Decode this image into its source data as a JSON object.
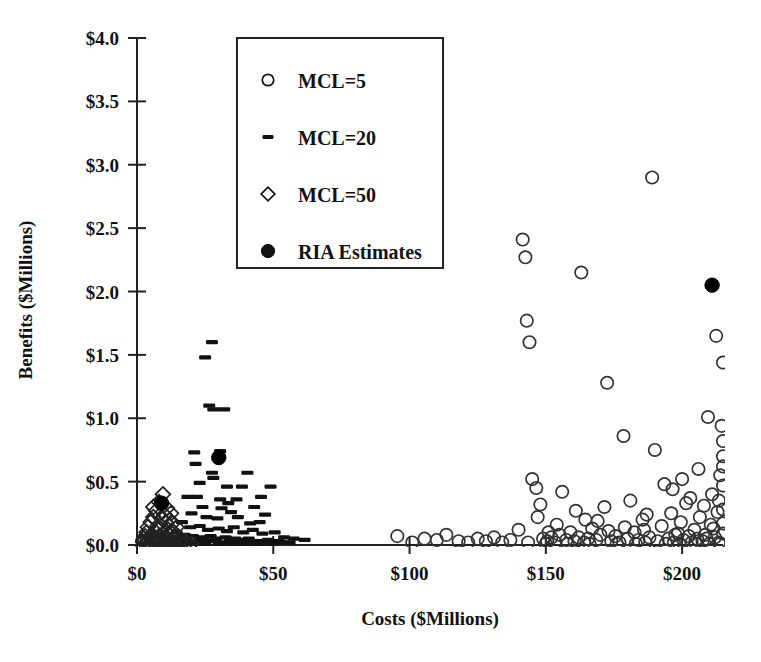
{
  "chart_data": {
    "type": "scatter",
    "title": "",
    "xlabel": "Costs ($Millions)",
    "ylabel": "Benefits ($Millions)",
    "xlim": [
      0,
      215
    ],
    "ylim": [
      0,
      4.0
    ],
    "xticks": [
      0,
      50,
      100,
      150,
      200
    ],
    "xticklabels": [
      "$0",
      "$50",
      "$100",
      "$150",
      "$200"
    ],
    "yticks": [
      0.0,
      0.5,
      1.0,
      1.5,
      2.0,
      2.5,
      3.0,
      3.5,
      4.0
    ],
    "yticklabels": [
      "$0.0",
      "$0.5",
      "$1.0",
      "$1.5",
      "$2.0",
      "$2.5",
      "$3.0",
      "$3.5",
      "$4.0"
    ],
    "grid": false,
    "legend_position": "upper-left-inside",
    "series": [
      {
        "name": "MCL=5",
        "marker": "open-circle",
        "color": "#333333",
        "points": [
          [
            95.5,
            0.07
          ],
          [
            101.0,
            0.02
          ],
          [
            105.5,
            0.05
          ],
          [
            110.0,
            0.04
          ],
          [
            113.5,
            0.08
          ],
          [
            118.0,
            0.03
          ],
          [
            121.5,
            0.02
          ],
          [
            125.0,
            0.05
          ],
          [
            128.0,
            0.03
          ],
          [
            131.0,
            0.06
          ],
          [
            134.0,
            0.02
          ],
          [
            137.0,
            0.04
          ],
          [
            140.0,
            0.12
          ],
          [
            141.5,
            2.41
          ],
          [
            142.5,
            2.27
          ],
          [
            143.0,
            1.77
          ],
          [
            144.0,
            1.6
          ],
          [
            145.0,
            0.52
          ],
          [
            146.5,
            0.45
          ],
          [
            148.0,
            0.32
          ],
          [
            149.0,
            0.05
          ],
          [
            150.5,
            0.03
          ],
          [
            152.0,
            0.06
          ],
          [
            153.5,
            0.02
          ],
          [
            155.0,
            0.08
          ],
          [
            156.0,
            0.42
          ],
          [
            157.5,
            0.04
          ],
          [
            159.0,
            0.1
          ],
          [
            160.5,
            0.03
          ],
          [
            162.0,
            0.06
          ],
          [
            163.0,
            2.15
          ],
          [
            164.0,
            0.02
          ],
          [
            165.5,
            0.05
          ],
          [
            167.0,
            0.13
          ],
          [
            168.5,
            0.04
          ],
          [
            170.0,
            0.08
          ],
          [
            171.5,
            0.3
          ],
          [
            172.5,
            1.28
          ],
          [
            174.0,
            0.03
          ],
          [
            175.5,
            0.07
          ],
          [
            177.0,
            0.02
          ],
          [
            178.5,
            0.86
          ],
          [
            180.0,
            0.05
          ],
          [
            181.0,
            0.35
          ],
          [
            182.5,
            0.1
          ],
          [
            184.0,
            0.04
          ],
          [
            185.5,
            0.2
          ],
          [
            186.5,
            0.02
          ],
          [
            188.0,
            0.06
          ],
          [
            189.0,
            2.9
          ],
          [
            190.0,
            0.75
          ],
          [
            191.0,
            0.03
          ],
          [
            192.5,
            0.15
          ],
          [
            193.5,
            0.48
          ],
          [
            195.0,
            0.05
          ],
          [
            196.0,
            0.25
          ],
          [
            197.0,
            0.02
          ],
          [
            198.5,
            0.09
          ],
          [
            199.5,
            0.18
          ],
          [
            200.5,
            0.04
          ],
          [
            201.5,
            0.33
          ],
          [
            202.5,
            0.07
          ],
          [
            203.5,
            0.02
          ],
          [
            204.5,
            0.12
          ],
          [
            205.5,
            0.05
          ],
          [
            206.5,
            0.22
          ],
          [
            207.5,
            0.03
          ],
          [
            208.5,
            0.08
          ],
          [
            209.5,
            1.01
          ],
          [
            210.5,
            0.16
          ],
          [
            211.0,
            0.4
          ],
          [
            212.0,
            0.06
          ],
          [
            212.5,
            1.65
          ],
          [
            213.0,
            0.26
          ],
          [
            213.5,
            0.02
          ],
          [
            214.0,
            0.55
          ],
          [
            214.5,
            0.94
          ],
          [
            215.0,
            1.44
          ],
          [
            215.0,
            0.82
          ],
          [
            215.0,
            0.7
          ],
          [
            215.0,
            0.62
          ],
          [
            215.0,
            0.47
          ],
          [
            215.0,
            0.28
          ],
          [
            215.0,
            0.17
          ],
          [
            215.0,
            0.09
          ],
          [
            150.0,
            0.01
          ],
          [
            158.0,
            0.01
          ],
          [
            166.0,
            0.01
          ],
          [
            176.0,
            0.01
          ],
          [
            183.0,
            0.01
          ],
          [
            194.0,
            0.01
          ],
          [
            199.0,
            0.01
          ],
          [
            205.0,
            0.01
          ],
          [
            210.0,
            0.01
          ],
          [
            214.0,
            0.01
          ],
          [
            147.0,
            0.22
          ],
          [
            154.0,
            0.16
          ],
          [
            161.0,
            0.27
          ],
          [
            169.0,
            0.19
          ],
          [
            173.0,
            0.11
          ],
          [
            179.0,
            0.14
          ],
          [
            187.0,
            0.24
          ],
          [
            196.5,
            0.44
          ],
          [
            203.0,
            0.37
          ],
          [
            208.0,
            0.31
          ],
          [
            143.5,
            0.02
          ],
          [
            151.0,
            0.1
          ],
          [
            164.5,
            0.2
          ],
          [
            186.0,
            0.12
          ],
          [
            200.0,
            0.52
          ],
          [
            206.0,
            0.6
          ],
          [
            211.5,
            0.13
          ],
          [
            213.5,
            0.35
          ],
          [
            209.0,
            0.05
          ],
          [
            197.5,
            0.08
          ]
        ]
      },
      {
        "name": "MCL=20",
        "marker": "dash",
        "color": "#111111",
        "points": [
          [
            27.5,
            1.6
          ],
          [
            25.0,
            1.48
          ],
          [
            26.5,
            1.1
          ],
          [
            28.0,
            1.07
          ],
          [
            32.0,
            1.07
          ],
          [
            21.0,
            0.73
          ],
          [
            21.5,
            0.64
          ],
          [
            27.5,
            0.57
          ],
          [
            28.0,
            0.53
          ],
          [
            40.5,
            0.57
          ],
          [
            38.5,
            0.46
          ],
          [
            49.0,
            0.46
          ],
          [
            18.5,
            0.38
          ],
          [
            22.0,
            0.38
          ],
          [
            30.5,
            0.36
          ],
          [
            33.5,
            0.33
          ],
          [
            36.5,
            0.36
          ],
          [
            24.0,
            0.3
          ],
          [
            31.0,
            0.29
          ],
          [
            34.5,
            0.26
          ],
          [
            43.0,
            0.3
          ],
          [
            47.0,
            0.24
          ],
          [
            20.0,
            0.25
          ],
          [
            25.5,
            0.22
          ],
          [
            29.5,
            0.21
          ],
          [
            37.0,
            0.22
          ],
          [
            41.5,
            0.17
          ],
          [
            45.0,
            0.18
          ],
          [
            16.5,
            0.18
          ],
          [
            19.5,
            0.14
          ],
          [
            23.0,
            0.15
          ],
          [
            26.0,
            0.12
          ],
          [
            30.0,
            0.13
          ],
          [
            33.0,
            0.11
          ],
          [
            35.5,
            0.14
          ],
          [
            39.0,
            0.1
          ],
          [
            42.5,
            0.12
          ],
          [
            46.0,
            0.09
          ],
          [
            50.5,
            0.1
          ],
          [
            54.0,
            0.06
          ],
          [
            57.5,
            0.05
          ],
          [
            61.5,
            0.04
          ],
          [
            14.5,
            0.1
          ],
          [
            17.5,
            0.08
          ],
          [
            20.5,
            0.07
          ],
          [
            23.5,
            0.06
          ],
          [
            27.0,
            0.07
          ],
          [
            29.0,
            0.05
          ],
          [
            32.5,
            0.06
          ],
          [
            36.0,
            0.05
          ],
          [
            38.0,
            0.04
          ],
          [
            41.0,
            0.05
          ],
          [
            44.0,
            0.03
          ],
          [
            48.0,
            0.04
          ],
          [
            52.0,
            0.03
          ],
          [
            12.5,
            0.06
          ],
          [
            15.5,
            0.05
          ],
          [
            18.0,
            0.04
          ],
          [
            21.0,
            0.03
          ],
          [
            24.5,
            0.04
          ],
          [
            28.5,
            0.03
          ],
          [
            31.5,
            0.02
          ],
          [
            34.0,
            0.03
          ],
          [
            37.5,
            0.02
          ],
          [
            40.0,
            0.03
          ],
          [
            43.5,
            0.02
          ],
          [
            46.5,
            0.02
          ],
          [
            50.0,
            0.02
          ],
          [
            53.0,
            0.02
          ],
          [
            56.0,
            0.02
          ],
          [
            13.0,
            0.02
          ],
          [
            16.0,
            0.02
          ],
          [
            19.0,
            0.01
          ],
          [
            22.5,
            0.02
          ],
          [
            25.0,
            0.01
          ],
          [
            30.0,
            0.01
          ],
          [
            35.0,
            0.01
          ],
          [
            39.5,
            0.01
          ],
          [
            44.5,
            0.01
          ],
          [
            49.5,
            0.01
          ],
          [
            11.0,
            0.03
          ],
          [
            33.0,
            0.46
          ],
          [
            45.5,
            0.38
          ],
          [
            23.0,
            0.49
          ],
          [
            30.5,
            0.74
          ]
        ]
      },
      {
        "name": "MCL=50",
        "marker": "open-diamond",
        "color": "#222222",
        "points": [
          [
            9.5,
            0.4
          ],
          [
            8.0,
            0.34
          ],
          [
            11.0,
            0.29
          ],
          [
            12.5,
            0.25
          ],
          [
            7.0,
            0.27
          ],
          [
            6.0,
            0.22
          ],
          [
            9.0,
            0.21
          ],
          [
            10.5,
            0.18
          ],
          [
            13.0,
            0.17
          ],
          [
            14.5,
            0.14
          ],
          [
            5.0,
            0.18
          ],
          [
            7.5,
            0.15
          ],
          [
            8.5,
            0.13
          ],
          [
            11.5,
            0.12
          ],
          [
            13.5,
            0.1
          ],
          [
            4.0,
            0.14
          ],
          [
            6.5,
            0.11
          ],
          [
            9.5,
            0.09
          ],
          [
            12.0,
            0.08
          ],
          [
            15.0,
            0.07
          ],
          [
            3.5,
            0.1
          ],
          [
            5.5,
            0.08
          ],
          [
            8.0,
            0.07
          ],
          [
            10.0,
            0.06
          ],
          [
            14.0,
            0.05
          ],
          [
            3.0,
            0.07
          ],
          [
            4.5,
            0.06
          ],
          [
            6.0,
            0.05
          ],
          [
            7.5,
            0.04
          ],
          [
            9.0,
            0.04
          ],
          [
            11.0,
            0.04
          ],
          [
            13.0,
            0.03
          ],
          [
            16.0,
            0.04
          ],
          [
            2.5,
            0.05
          ],
          [
            4.0,
            0.03
          ],
          [
            5.5,
            0.03
          ],
          [
            7.0,
            0.02
          ],
          [
            8.5,
            0.02
          ],
          [
            10.5,
            0.02
          ],
          [
            12.5,
            0.02
          ],
          [
            15.5,
            0.02
          ],
          [
            17.5,
            0.03
          ],
          [
            2.0,
            0.03
          ],
          [
            3.5,
            0.02
          ],
          [
            5.0,
            0.01
          ],
          [
            6.5,
            0.01
          ],
          [
            8.0,
            0.01
          ],
          [
            9.5,
            0.01
          ],
          [
            11.5,
            0.01
          ],
          [
            14.0,
            0.01
          ],
          [
            16.5,
            0.01
          ],
          [
            18.5,
            0.02
          ],
          [
            20.0,
            0.01
          ],
          [
            1.5,
            0.01
          ],
          [
            3.0,
            0.01
          ],
          [
            10.0,
            0.24
          ],
          [
            12.0,
            0.2
          ],
          [
            6.0,
            0.3
          ]
        ]
      },
      {
        "name": "RIA Estimates",
        "marker": "filled-circle",
        "color": "#000000",
        "points": [
          [
            30.0,
            0.69
          ],
          [
            211.0,
            2.05
          ],
          [
            9.0,
            0.33
          ]
        ]
      }
    ]
  },
  "legend": {
    "entries": [
      {
        "label": "MCL=5",
        "marker": "open-circle"
      },
      {
        "label": "MCL=20",
        "marker": "dash"
      },
      {
        "label": "MCL=50",
        "marker": "open-diamond"
      },
      {
        "label": "RIA Estimates",
        "marker": "filled-circle"
      }
    ]
  }
}
